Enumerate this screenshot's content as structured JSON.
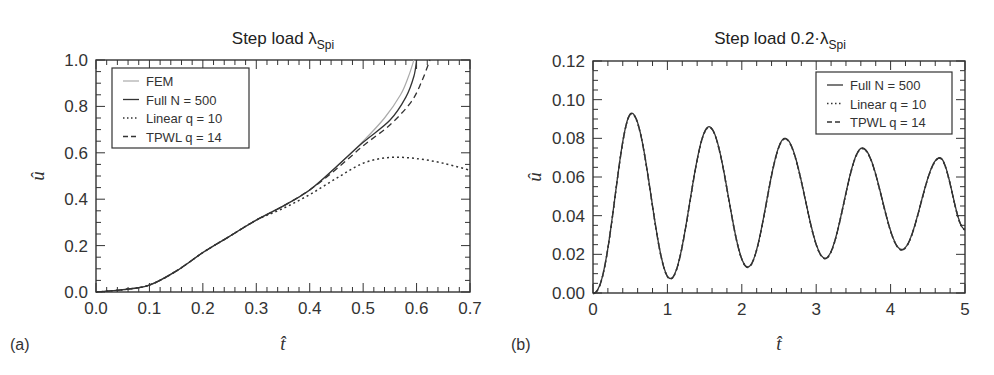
{
  "chart_data": [
    {
      "panel": "(a)",
      "type": "line",
      "title": "Step load λSpi",
      "title_main": "Step load λ",
      "title_sub": "Spi",
      "xlabel": "t̂",
      "ylabel": "û",
      "xlim": [
        0.0,
        0.7
      ],
      "ylim": [
        0.0,
        1.0
      ],
      "xticks": [
        "0.0",
        "0.1",
        "0.2",
        "0.3",
        "0.4",
        "0.5",
        "0.6",
        "0.7"
      ],
      "yticks": [
        "0.0",
        "0.2",
        "0.4",
        "0.6",
        "0.8",
        "1.0"
      ],
      "grid": false,
      "legend_position": "upper left",
      "series": [
        {
          "name": "FEM",
          "style": "solid-light",
          "x": [
            0.0,
            0.05,
            0.1,
            0.15,
            0.2,
            0.25,
            0.3,
            0.35,
            0.4,
            0.45,
            0.5,
            0.54,
            0.57,
            0.585,
            0.595
          ],
          "y": [
            0.0,
            0.01,
            0.03,
            0.09,
            0.17,
            0.24,
            0.31,
            0.37,
            0.44,
            0.54,
            0.65,
            0.75,
            0.85,
            0.93,
            1.0
          ]
        },
        {
          "name": "Full N = 500",
          "style": "solid",
          "x": [
            0.0,
            0.05,
            0.1,
            0.15,
            0.2,
            0.25,
            0.3,
            0.35,
            0.4,
            0.45,
            0.5,
            0.55,
            0.58,
            0.595,
            0.6
          ],
          "y": [
            0.0,
            0.01,
            0.03,
            0.09,
            0.17,
            0.24,
            0.31,
            0.37,
            0.44,
            0.54,
            0.645,
            0.74,
            0.84,
            0.93,
            1.0
          ]
        },
        {
          "name": "Linear q = 10",
          "style": "dotted",
          "x": [
            0.0,
            0.05,
            0.1,
            0.15,
            0.2,
            0.25,
            0.3,
            0.35,
            0.4,
            0.45,
            0.5,
            0.55,
            0.6,
            0.65,
            0.7
          ],
          "y": [
            0.0,
            0.01,
            0.03,
            0.09,
            0.17,
            0.24,
            0.31,
            0.36,
            0.42,
            0.49,
            0.555,
            0.58,
            0.575,
            0.555,
            0.525
          ]
        },
        {
          "name": "TPWL q = 14",
          "style": "dashed",
          "x": [
            0.0,
            0.05,
            0.1,
            0.15,
            0.2,
            0.25,
            0.3,
            0.35,
            0.4,
            0.45,
            0.5,
            0.55,
            0.59,
            0.61,
            0.625
          ],
          "y": [
            0.0,
            0.01,
            0.03,
            0.09,
            0.17,
            0.24,
            0.31,
            0.37,
            0.44,
            0.53,
            0.63,
            0.72,
            0.82,
            0.91,
            1.0
          ]
        }
      ]
    },
    {
      "panel": "(b)",
      "type": "line",
      "title": "Step load 0.2·λSpi",
      "title_main": "Step load 0.2·λ",
      "title_sub": "Spi",
      "xlabel": "t̂",
      "ylabel": "û",
      "xlim": [
        0,
        5
      ],
      "ylim": [
        0.0,
        0.12
      ],
      "xticks": [
        "0",
        "1",
        "2",
        "3",
        "4",
        "5"
      ],
      "yticks": [
        "0.00",
        "0.02",
        "0.04",
        "0.06",
        "0.08",
        "0.10",
        "0.12"
      ],
      "grid": false,
      "legend_position": "upper right",
      "peaks": [
        {
          "t": 0.52,
          "u": 0.093
        },
        {
          "t": 1.56,
          "u": 0.086
        },
        {
          "t": 2.58,
          "u": 0.08
        },
        {
          "t": 3.62,
          "u": 0.075
        },
        {
          "t": 4.66,
          "u": 0.07
        }
      ],
      "troughs": [
        {
          "t": 1.04,
          "u": 0.0075
        },
        {
          "t": 2.08,
          "u": 0.0135
        },
        {
          "t": 3.12,
          "u": 0.018
        },
        {
          "t": 4.15,
          "u": 0.0225
        }
      ],
      "series": [
        {
          "name": "Full N = 500",
          "style": "solid"
        },
        {
          "name": "Linear q = 10",
          "style": "dotted"
        },
        {
          "name": "TPWL q = 14",
          "style": "dashed"
        }
      ],
      "end_value": {
        "t": 5.0,
        "u": 0.033
      }
    }
  ]
}
